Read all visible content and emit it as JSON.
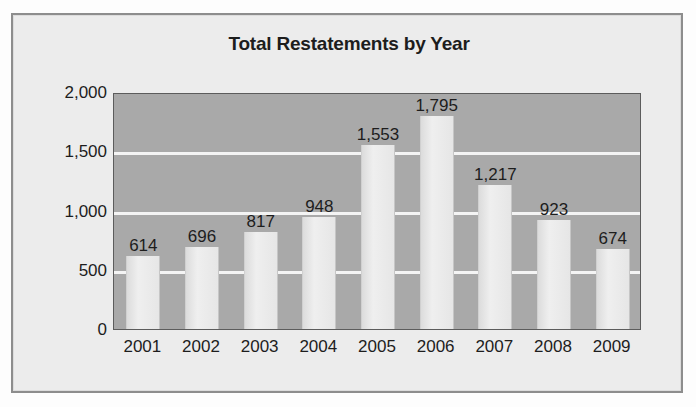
{
  "chart_data": {
    "type": "bar",
    "title": "Total Restatements by Year",
    "xlabel": "",
    "ylabel": "",
    "categories": [
      "2001",
      "2002",
      "2003",
      "2004",
      "2005",
      "2006",
      "2007",
      "2008",
      "2009"
    ],
    "values": [
      614,
      696,
      817,
      948,
      1553,
      1795,
      1217,
      923,
      674
    ],
    "value_labels": [
      "614",
      "696",
      "817",
      "948",
      "1,553",
      "1,795",
      "1,217",
      "923",
      "674"
    ],
    "ylim": [
      0,
      2000
    ],
    "yticks": [
      0,
      500,
      1000,
      1500,
      2000
    ],
    "ytick_labels": [
      "0",
      "500",
      "1,000",
      "1,500",
      "2,000"
    ],
    "grid": true,
    "legend": "none",
    "colors": {
      "plot_background": "#a9a9a9",
      "bar_fill": "#e9e9e9",
      "gridline": "#f4f4f4",
      "figure_background": "#ececec",
      "text": "#1d1d1d",
      "frame_border": "#8d8d8d"
    }
  }
}
